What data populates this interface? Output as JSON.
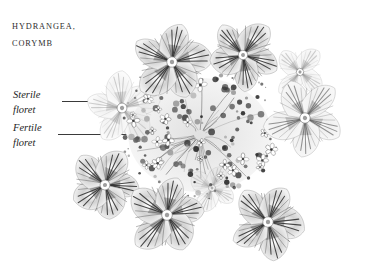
{
  "plate": {
    "background_color": "#ffffff",
    "medium": "grayscale engraving / pencil botanical illustration",
    "title_lines": [
      "Hydrangea,",
      "Corymb"
    ],
    "annotations": [
      {
        "label_line_1": "Sterile",
        "label_line_2": "floret",
        "leader": "short-rule-to-left-sterile-floret"
      },
      {
        "label_line_1": "Fertile",
        "label_line_2": "floret",
        "leader": "long-rule-to-central-fertile-cluster"
      }
    ],
    "ink_colors": {
      "darkest": "#2a2a2a",
      "mid_gray": "#6f6f6f",
      "light_gray": "#b9b9b9",
      "palest": "#e4e4e4",
      "text": "#1e1e1e"
    },
    "subject": {
      "common_name": "Hydrangea",
      "inflorescence_type": "Corymb",
      "sterile_floret_count": 9,
      "fertile_cluster_center": "center of corymb"
    },
    "sterile_florets": [
      {
        "cx": 172,
        "cy": 62,
        "r": 40,
        "rot": -8,
        "petals": 5,
        "tone": "dark"
      },
      {
        "cx": 243,
        "cy": 55,
        "r": 36,
        "rot": 14,
        "petals": 5,
        "tone": "dark"
      },
      {
        "cx": 122,
        "cy": 108,
        "r": 38,
        "rot": -22,
        "petals": 5,
        "tone": "light"
      },
      {
        "cx": 305,
        "cy": 118,
        "r": 40,
        "rot": 22,
        "petals": 5,
        "tone": "mid"
      },
      {
        "cx": 300,
        "cy": 72,
        "r": 28,
        "rot": 40,
        "petals": 4,
        "tone": "light"
      },
      {
        "cx": 105,
        "cy": 185,
        "r": 38,
        "rot": 8,
        "petals": 5,
        "tone": "dark"
      },
      {
        "cx": 167,
        "cy": 215,
        "r": 41,
        "rot": -12,
        "petals": 5,
        "tone": "dark"
      },
      {
        "cx": 268,
        "cy": 222,
        "r": 40,
        "rot": 6,
        "petals": 5,
        "tone": "dark"
      },
      {
        "cx": 212,
        "cy": 188,
        "r": 26,
        "rot": 28,
        "petals": 4,
        "tone": "light"
      }
    ],
    "fertile_cluster": {
      "cx": 200,
      "cy": 135,
      "rx": 78,
      "ry": 62,
      "bud_count": 120,
      "floret_count": 26,
      "description": "dense mass of tiny 4-5 petalled fertile florets and dark unopened buds"
    }
  }
}
